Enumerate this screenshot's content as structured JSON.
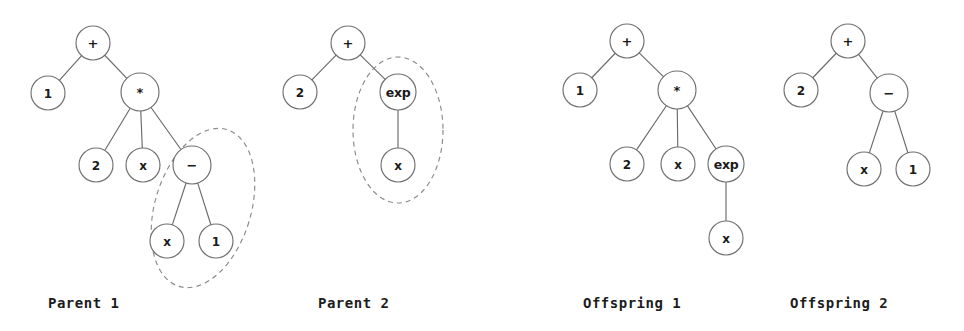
{
  "figure": {
    "background_color": "#ffffff",
    "node_fill": "#ffffff",
    "node_stroke": "#6f6f6f",
    "edge_color": "#6b6b6b",
    "selection_color": "#8a8a8a",
    "text_color": "#1a1a1a"
  },
  "panels": [
    {
      "id": "parent-1",
      "caption": "Parent 1",
      "caption_x": 48,
      "caption_y": 295,
      "nodes": [
        {
          "id": "p1-plus",
          "label": "+",
          "x": 93,
          "y": 43,
          "r": 17,
          "style": "op-plus"
        },
        {
          "id": "p1-one",
          "label": "1",
          "x": 48,
          "y": 93,
          "r": 17,
          "style": "small"
        },
        {
          "id": "p1-star",
          "label": "*",
          "x": 140,
          "y": 92,
          "r": 19,
          "style": "op-star"
        },
        {
          "id": "p1-two",
          "label": "2",
          "x": 96,
          "y": 165,
          "r": 17,
          "style": "small"
        },
        {
          "id": "p1-x",
          "label": "x",
          "x": 143,
          "y": 165,
          "r": 17,
          "style": "small"
        },
        {
          "id": "p1-minus",
          "label": "−",
          "x": 192,
          "y": 165,
          "r": 19,
          "style": "op-minus"
        },
        {
          "id": "p1-x2",
          "label": "x",
          "x": 167,
          "y": 241,
          "r": 17,
          "style": "small"
        },
        {
          "id": "p1-one2",
          "label": "1",
          "x": 216,
          "y": 241,
          "r": 17,
          "style": "small"
        }
      ],
      "edges": [
        [
          "p1-plus",
          "p1-one"
        ],
        [
          "p1-plus",
          "p1-star"
        ],
        [
          "p1-star",
          "p1-two"
        ],
        [
          "p1-star",
          "p1-x"
        ],
        [
          "p1-star",
          "p1-minus"
        ],
        [
          "p1-minus",
          "p1-x2"
        ],
        [
          "p1-minus",
          "p1-one2"
        ]
      ],
      "selection": {
        "label": "crossover-subtree-parent-1",
        "cx": 203,
        "cy": 208,
        "rx": 48,
        "ry": 82,
        "rotate": 17
      }
    },
    {
      "id": "parent-2",
      "caption": "Parent 2",
      "caption_x": 318,
      "caption_y": 295,
      "nodes": [
        {
          "id": "p2-plus",
          "label": "+",
          "x": 348,
          "y": 43,
          "r": 17,
          "style": "op-plus"
        },
        {
          "id": "p2-two",
          "label": "2",
          "x": 300,
          "y": 92,
          "r": 17,
          "style": "small"
        },
        {
          "id": "p2-exp",
          "label": "exp",
          "x": 398,
          "y": 92,
          "r": 18,
          "style": "exp-label"
        },
        {
          "id": "p2-x",
          "label": "x",
          "x": 398,
          "y": 165,
          "r": 17,
          "style": "small"
        }
      ],
      "edges": [
        [
          "p2-plus",
          "p2-two"
        ],
        [
          "p2-plus",
          "p2-exp"
        ],
        [
          "p2-exp",
          "p2-x"
        ]
      ],
      "selection": {
        "label": "crossover-subtree-parent-2",
        "cx": 398,
        "cy": 130,
        "rx": 45,
        "ry": 73,
        "rotate": 0
      }
    },
    {
      "id": "offspring-1",
      "caption": "Offspring 1",
      "caption_x": 583,
      "caption_y": 295,
      "nodes": [
        {
          "id": "o1-plus",
          "label": "+",
          "x": 627,
          "y": 41,
          "r": 17,
          "style": "op-plus"
        },
        {
          "id": "o1-one",
          "label": "1",
          "x": 580,
          "y": 90,
          "r": 17,
          "style": "small"
        },
        {
          "id": "o1-star",
          "label": "*",
          "x": 677,
          "y": 90,
          "r": 19,
          "style": "op-star"
        },
        {
          "id": "o1-two",
          "label": "2",
          "x": 627,
          "y": 164,
          "r": 17,
          "style": "small"
        },
        {
          "id": "o1-x",
          "label": "x",
          "x": 678,
          "y": 164,
          "r": 17,
          "style": "small"
        },
        {
          "id": "o1-exp",
          "label": "exp",
          "x": 726,
          "y": 164,
          "r": 18,
          "style": "exp-label"
        },
        {
          "id": "o1-x2",
          "label": "x",
          "x": 726,
          "y": 238,
          "r": 17,
          "style": "small"
        }
      ],
      "edges": [
        [
          "o1-plus",
          "o1-one"
        ],
        [
          "o1-plus",
          "o1-star"
        ],
        [
          "o1-star",
          "o1-two"
        ],
        [
          "o1-star",
          "o1-x"
        ],
        [
          "o1-star",
          "o1-exp"
        ],
        [
          "o1-exp",
          "o1-x2"
        ]
      ],
      "selection": null
    },
    {
      "id": "offspring-2",
      "caption": "Offspring 2",
      "caption_x": 790,
      "caption_y": 295,
      "nodes": [
        {
          "id": "o2-plus",
          "label": "+",
          "x": 848,
          "y": 41,
          "r": 17,
          "style": "op-plus"
        },
        {
          "id": "o2-two",
          "label": "2",
          "x": 801,
          "y": 90,
          "r": 17,
          "style": "small"
        },
        {
          "id": "o2-minus",
          "label": "−",
          "x": 889,
          "y": 93,
          "r": 19,
          "style": "op-minus"
        },
        {
          "id": "o2-x",
          "label": "x",
          "x": 864,
          "y": 169,
          "r": 17,
          "style": "small"
        },
        {
          "id": "o2-one",
          "label": "1",
          "x": 913,
          "y": 169,
          "r": 17,
          "style": "small"
        }
      ],
      "edges": [
        [
          "o2-plus",
          "o2-two"
        ],
        [
          "o2-plus",
          "o2-minus"
        ],
        [
          "o2-minus",
          "o2-x"
        ],
        [
          "o2-minus",
          "o2-one"
        ]
      ],
      "selection": null
    }
  ]
}
